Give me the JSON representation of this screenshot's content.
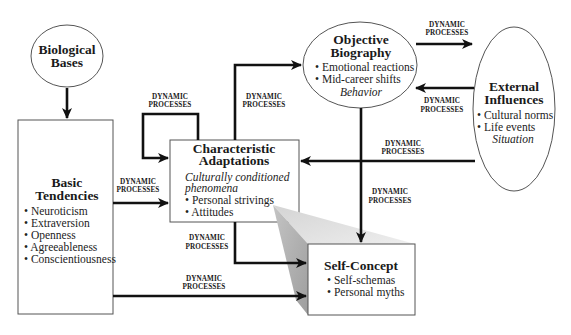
{
  "bullet": "•",
  "nodes": {
    "biological_bases": {
      "title": [
        "Biological",
        "Bases"
      ]
    },
    "basic_tendencies": {
      "title": [
        "Basic",
        "Tendencies"
      ],
      "items": [
        "Neuroticism",
        "Extraversion",
        "Openness",
        "Agreeableness",
        "Conscientiousness"
      ]
    },
    "characteristic_adaptations": {
      "title": [
        "Characteristic",
        "Adaptations"
      ],
      "subtitle": [
        "Culturally conditioned",
        "phenomena"
      ],
      "items": [
        "Personal strivings",
        "Attitudes"
      ]
    },
    "objective_biography": {
      "title": [
        "Objective",
        "Biography"
      ],
      "items": [
        "Emotional reactions",
        "Mid-career shifts"
      ],
      "caption": "Behavior"
    },
    "external_influences": {
      "title": [
        "External",
        "Influences"
      ],
      "items": [
        "Cultural norms",
        "Life events"
      ],
      "caption": "Situation"
    },
    "self_concept": {
      "title": "Self-Concept",
      "items": [
        "Self-schemas",
        "Personal myths"
      ]
    }
  },
  "edges": [
    {
      "from": "Biological Bases",
      "to": "Basic Tendencies",
      "label": []
    },
    {
      "from": "Basic Tendencies",
      "to": "Characteristic Adaptations",
      "label": [
        "DYNAMIC",
        "PROCESSES"
      ]
    },
    {
      "from": "Characteristic Adaptations",
      "to": "Characteristic Adaptations",
      "label": [
        "DYNAMIC",
        "PROCESSES"
      ]
    },
    {
      "from": "Characteristic Adaptations",
      "to": "Objective Biography",
      "label": [
        "DYNAMIC",
        "PROCESSES"
      ]
    },
    {
      "from": "Objective Biography",
      "to": "External Influences",
      "label": [
        "DYNAMIC",
        "PROCESSES"
      ]
    },
    {
      "from": "External Influences",
      "to": "Objective Biography",
      "label": [
        "DYNAMIC",
        "PROCESSES"
      ]
    },
    {
      "from": "External Influences",
      "to": "Characteristic Adaptations",
      "label": [
        "DYNAMIC",
        "PROCESSES"
      ]
    },
    {
      "from": "Objective Biography",
      "to": "Self-Concept",
      "label": [
        "DYNAMIC",
        "PROCESSES"
      ]
    },
    {
      "from": "Characteristic Adaptations",
      "to": "Self-Concept",
      "label": [
        "DYNAMIC",
        "PROCESSES"
      ]
    },
    {
      "from": "Basic Tendencies",
      "to": "Self-Concept",
      "label": [
        "DYNAMIC",
        "PROCESSES"
      ]
    }
  ],
  "colors": {
    "background": "#ffffff",
    "line": "#111111",
    "shadow_light": "#dcdcdc",
    "shadow_dark": "#a8a8a8"
  }
}
